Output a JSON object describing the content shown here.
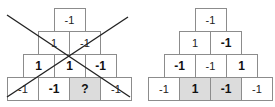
{
  "figure": {
    "left_pyramid": {
      "crossed_out": true,
      "rows": [
        [
          {
            "text": "-1",
            "bold": false,
            "shaded": false
          }
        ],
        [
          {
            "text": "1",
            "bold": false,
            "shaded": false
          },
          {
            "text": "-1",
            "bold": false,
            "shaded": false
          }
        ],
        [
          {
            "text": "1",
            "bold": true,
            "shaded": false
          },
          {
            "text": "1",
            "bold": true,
            "shaded": false
          },
          {
            "text": "-1",
            "bold": true,
            "shaded": false
          }
        ],
        [
          {
            "text": "-1",
            "bold": false,
            "shaded": false
          },
          {
            "text": "-1",
            "bold": true,
            "shaded": false
          },
          {
            "text": "?",
            "bold": true,
            "shaded": true
          },
          {
            "text": "-1",
            "bold": false,
            "shaded": false
          }
        ]
      ]
    },
    "right_pyramid": {
      "crossed_out": false,
      "rows": [
        [
          {
            "text": "-1",
            "bold": false,
            "shaded": false
          }
        ],
        [
          {
            "text": "1",
            "bold": false,
            "shaded": false
          },
          {
            "text": "-1",
            "bold": true,
            "shaded": false
          }
        ],
        [
          {
            "text": "-1",
            "bold": true,
            "shaded": false
          },
          {
            "text": "-1",
            "bold": false,
            "shaded": false
          },
          {
            "text": "1",
            "bold": true,
            "shaded": false
          }
        ],
        [
          {
            "text": "-1",
            "bold": false,
            "shaded": false
          },
          {
            "text": "1",
            "bold": true,
            "shaded": true
          },
          {
            "text": "-1",
            "bold": true,
            "shaded": true
          },
          {
            "text": "-1",
            "bold": false,
            "shaded": false
          }
        ]
      ]
    },
    "colors": {
      "cell_border": "#8c8c8c",
      "shaded_fill": "#dcdcdc",
      "cross_line": "#222222"
    }
  }
}
